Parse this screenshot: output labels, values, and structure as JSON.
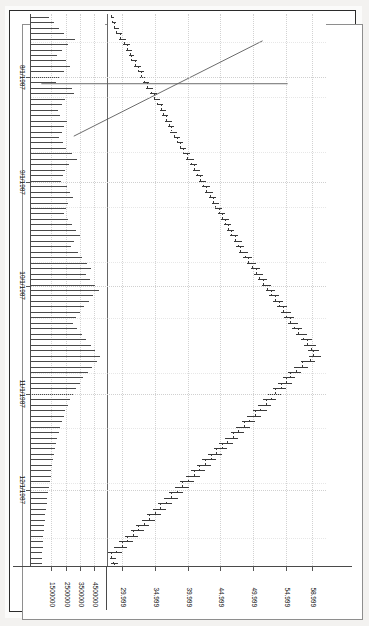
{
  "app": {
    "name": "TradeStation",
    "watermark": "Created with TradeStation www.TradeStation.com"
  },
  "chart_header": {
    "symbol_line": "AAPL-Daily"
  },
  "chart_data": {
    "type": "ohlc",
    "title": "AAPL-Daily",
    "subtitle": "Created with TradeStation www.TradeStation.com",
    "xlabel": "",
    "ylabel": "",
    "orientation": "page-rotated-90",
    "grid": true,
    "legend": "none",
    "price_axis": {
      "ticks": [
        "58.999",
        "54.999",
        "49.999",
        "44.999",
        "39.999",
        "34.999",
        "29.999"
      ],
      "values": [
        58.999,
        54.999,
        49.999,
        44.999,
        39.999,
        34.999,
        29.999
      ],
      "ylim": [
        27.5,
        61.0
      ]
    },
    "volume_axis": {
      "ticks": [
        "4500000",
        "3500000",
        "2500000",
        "1500000"
      ],
      "values": [
        4500000,
        3500000,
        2500000,
        1500000
      ],
      "ylim": [
        0,
        5200000
      ]
    },
    "date_axis": {
      "ticks": [
        "8/1/1987",
        "9/1/1987",
        "10/1/1987",
        "11/1/1987",
        "12/1/1987"
      ],
      "positions": [
        0.115,
        0.305,
        0.492,
        0.688,
        0.862
      ]
    },
    "annotations": [
      {
        "name": "downtrend-line-upper",
        "x1": 0.045,
        "y1": 0.215,
        "x2": 0.205,
        "y2": 0.855
      },
      {
        "name": "vertical-marker-line",
        "x1": 0.117,
        "y1": 0.13,
        "x2": 0.117,
        "y2": 0.965
      }
    ],
    "bars": [
      {
        "o": 28.3,
        "h": 28.6,
        "l": 28.05,
        "c": 28.4,
        "v": 1250000
      },
      {
        "o": 28.4,
        "h": 28.95,
        "l": 28.25,
        "c": 28.8,
        "v": 1640000
      },
      {
        "o": 28.8,
        "h": 29.3,
        "l": 28.6,
        "c": 29.1,
        "v": 1980000
      },
      {
        "o": 29.1,
        "h": 29.8,
        "l": 28.95,
        "c": 29.6,
        "v": 2350000
      },
      {
        "o": 29.6,
        "h": 30.4,
        "l": 29.4,
        "c": 30.2,
        "v": 3100000
      },
      {
        "o": 30.2,
        "h": 30.95,
        "l": 30.0,
        "c": 30.7,
        "v": 2600000
      },
      {
        "o": 30.7,
        "h": 31.4,
        "l": 30.45,
        "c": 31.1,
        "v": 2150000
      },
      {
        "o": 31.1,
        "h": 31.6,
        "l": 30.85,
        "c": 31.25,
        "v": 1820000
      },
      {
        "o": 31.25,
        "h": 32.1,
        "l": 31.1,
        "c": 31.9,
        "v": 2480000
      },
      {
        "o": 31.9,
        "h": 32.7,
        "l": 31.7,
        "c": 32.45,
        "v": 2720000
      },
      {
        "o": 32.45,
        "h": 33.1,
        "l": 32.2,
        "c": 32.85,
        "v": 2300000
      },
      {
        "o": 32.85,
        "h": 33.5,
        "l": 32.6,
        "c": 33.3,
        "v": 1960000
      },
      {
        "o": 33.3,
        "h": 33.95,
        "l": 33.05,
        "c": 33.7,
        "v": 1740000
      },
      {
        "o": 33.7,
        "h": 34.6,
        "l": 33.5,
        "c": 34.4,
        "v": 2880000
      },
      {
        "o": 34.4,
        "h": 35.2,
        "l": 34.1,
        "c": 34.9,
        "v": 3050000
      },
      {
        "o": 34.9,
        "h": 35.6,
        "l": 34.65,
        "c": 35.35,
        "v": 2420000
      },
      {
        "o": 35.35,
        "h": 36.1,
        "l": 35.1,
        "c": 35.85,
        "v": 2190000
      },
      {
        "o": 35.85,
        "h": 36.5,
        "l": 35.55,
        "c": 36.2,
        "v": 1880000
      },
      {
        "o": 36.2,
        "h": 36.9,
        "l": 35.95,
        "c": 36.65,
        "v": 2060000
      },
      {
        "o": 36.65,
        "h": 37.4,
        "l": 36.4,
        "c": 37.1,
        "v": 2540000
      },
      {
        "o": 37.1,
        "h": 37.8,
        "l": 36.85,
        "c": 37.45,
        "v": 2310000
      },
      {
        "o": 37.45,
        "h": 38.2,
        "l": 37.2,
        "c": 37.95,
        "v": 2170000
      },
      {
        "o": 37.95,
        "h": 38.7,
        "l": 37.7,
        "c": 38.4,
        "v": 1990000
      },
      {
        "o": 38.4,
        "h": 39.1,
        "l": 38.15,
        "c": 38.85,
        "v": 2260000
      },
      {
        "o": 38.85,
        "h": 39.6,
        "l": 38.6,
        "c": 39.3,
        "v": 2480000
      },
      {
        "o": 39.3,
        "h": 40.2,
        "l": 39.05,
        "c": 39.9,
        "v": 2900000
      },
      {
        "o": 39.9,
        "h": 40.8,
        "l": 39.65,
        "c": 40.5,
        "v": 3200000
      },
      {
        "o": 40.5,
        "h": 41.3,
        "l": 40.2,
        "c": 40.95,
        "v": 2650000
      },
      {
        "o": 40.95,
        "h": 41.7,
        "l": 40.7,
        "c": 41.4,
        "v": 2410000
      },
      {
        "o": 41.4,
        "h": 42.2,
        "l": 41.1,
        "c": 41.85,
        "v": 2280000
      },
      {
        "o": 41.85,
        "h": 42.6,
        "l": 41.55,
        "c": 42.3,
        "v": 2120000
      },
      {
        "o": 42.3,
        "h": 43.2,
        "l": 42.0,
        "c": 42.85,
        "v": 2560000
      },
      {
        "o": 42.85,
        "h": 43.7,
        "l": 42.55,
        "c": 43.35,
        "v": 2740000
      },
      {
        "o": 43.35,
        "h": 44.2,
        "l": 43.05,
        "c": 43.8,
        "v": 2930000
      },
      {
        "o": 43.8,
        "h": 44.6,
        "l": 43.5,
        "c": 44.2,
        "v": 2610000
      },
      {
        "o": 44.2,
        "h": 45.1,
        "l": 43.95,
        "c": 44.75,
        "v": 2480000
      },
      {
        "o": 44.75,
        "h": 45.6,
        "l": 44.45,
        "c": 45.2,
        "v": 2350000
      },
      {
        "o": 45.2,
        "h": 46.1,
        "l": 44.9,
        "c": 45.7,
        "v": 2620000
      },
      {
        "o": 45.7,
        "h": 46.5,
        "l": 45.4,
        "c": 46.1,
        "v": 2870000
      },
      {
        "o": 46.1,
        "h": 47.0,
        "l": 45.8,
        "c": 46.6,
        "v": 3140000
      },
      {
        "o": 46.6,
        "h": 47.6,
        "l": 46.3,
        "c": 47.2,
        "v": 3460000
      },
      {
        "o": 47.2,
        "h": 48.1,
        "l": 46.85,
        "c": 47.65,
        "v": 3050000
      },
      {
        "o": 47.65,
        "h": 48.5,
        "l": 47.3,
        "c": 48.05,
        "v": 2780000
      },
      {
        "o": 48.05,
        "h": 49.1,
        "l": 47.75,
        "c": 48.7,
        "v": 3320000
      },
      {
        "o": 48.7,
        "h": 49.7,
        "l": 48.35,
        "c": 49.25,
        "v": 3580000
      },
      {
        "o": 49.25,
        "h": 50.3,
        "l": 48.95,
        "c": 49.85,
        "v": 3910000
      },
      {
        "o": 49.85,
        "h": 50.9,
        "l": 49.5,
        "c": 50.4,
        "v": 4250000
      },
      {
        "o": 50.4,
        "h": 51.4,
        "l": 50.05,
        "c": 50.95,
        "v": 3880000
      },
      {
        "o": 50.95,
        "h": 52.0,
        "l": 50.6,
        "c": 51.55,
        "v": 4120000
      },
      {
        "o": 51.55,
        "h": 52.6,
        "l": 51.2,
        "c": 52.1,
        "v": 4480000
      },
      {
        "o": 52.1,
        "h": 53.2,
        "l": 51.75,
        "c": 52.7,
        "v": 4760000
      },
      {
        "o": 52.7,
        "h": 53.8,
        "l": 52.3,
        "c": 53.3,
        "v": 4390000
      },
      {
        "o": 53.3,
        "h": 54.4,
        "l": 52.9,
        "c": 53.9,
        "v": 4050000
      },
      {
        "o": 53.9,
        "h": 55.0,
        "l": 53.5,
        "c": 54.5,
        "v": 3720000
      },
      {
        "o": 54.5,
        "h": 55.6,
        "l": 54.1,
        "c": 55.05,
        "v": 3410000
      },
      {
        "o": 55.05,
        "h": 56.1,
        "l": 54.6,
        "c": 55.6,
        "v": 3180000
      },
      {
        "o": 55.6,
        "h": 56.7,
        "l": 55.2,
        "c": 56.2,
        "v": 2960000
      },
      {
        "o": 56.2,
        "h": 57.4,
        "l": 55.8,
        "c": 56.9,
        "v": 3240000
      },
      {
        "o": 56.9,
        "h": 58.1,
        "l": 56.45,
        "c": 57.6,
        "v": 3560000
      },
      {
        "o": 57.6,
        "h": 58.8,
        "l": 57.1,
        "c": 58.2,
        "v": 3880000
      },
      {
        "o": 58.2,
        "h": 59.4,
        "l": 57.7,
        "c": 58.8,
        "v": 4200000
      },
      {
        "o": 58.8,
        "h": 59.9,
        "l": 58.2,
        "c": 59.2,
        "v": 4520000
      },
      {
        "o": 59.2,
        "h": 60.2,
        "l": 58.4,
        "c": 58.7,
        "v": 4880000
      },
      {
        "o": 58.7,
        "h": 59.3,
        "l": 57.1,
        "c": 57.5,
        "v": 4640000
      },
      {
        "o": 57.5,
        "h": 58.2,
        "l": 56.1,
        "c": 56.6,
        "v": 4310000
      },
      {
        "o": 56.6,
        "h": 57.1,
        "l": 55.2,
        "c": 55.6,
        "v": 3980000
      },
      {
        "o": 55.6,
        "h": 56.3,
        "l": 54.4,
        "c": 55.0,
        "v": 3650000
      },
      {
        "o": 55.0,
        "h": 55.8,
        "l": 53.7,
        "c": 54.2,
        "v": 3420000
      },
      {
        "o": 54.2,
        "h": 54.9,
        "l": 52.9,
        "c": 53.4,
        "v": 3180000
      },
      {
        "o": 53.4,
        "h": 54.1,
        "l": 52.2,
        "c": 52.7,
        "v": 2940000
      },
      {
        "o": 52.7,
        "h": 53.4,
        "l": 51.4,
        "c": 51.9,
        "v": 2760000
      },
      {
        "o": 51.9,
        "h": 52.6,
        "l": 50.6,
        "c": 51.1,
        "v": 2580000
      },
      {
        "o": 51.1,
        "h": 51.9,
        "l": 49.8,
        "c": 50.3,
        "v": 2410000
      },
      {
        "o": 50.3,
        "h": 51.0,
        "l": 48.9,
        "c": 49.4,
        "v": 2290000
      },
      {
        "o": 49.4,
        "h": 50.2,
        "l": 48.1,
        "c": 48.6,
        "v": 2170000
      },
      {
        "o": 48.6,
        "h": 49.3,
        "l": 47.2,
        "c": 47.7,
        "v": 2050000
      },
      {
        "o": 47.7,
        "h": 48.5,
        "l": 46.4,
        "c": 46.9,
        "v": 1940000
      },
      {
        "o": 46.9,
        "h": 47.6,
        "l": 45.5,
        "c": 46.0,
        "v": 1830000
      },
      {
        "o": 46.0,
        "h": 46.8,
        "l": 44.7,
        "c": 45.2,
        "v": 1760000
      },
      {
        "o": 45.2,
        "h": 45.9,
        "l": 43.8,
        "c": 44.3,
        "v": 1690000
      },
      {
        "o": 44.3,
        "h": 45.1,
        "l": 43.0,
        "c": 43.5,
        "v": 1620000
      },
      {
        "o": 43.5,
        "h": 44.2,
        "l": 42.1,
        "c": 42.6,
        "v": 1560000
      },
      {
        "o": 42.6,
        "h": 43.4,
        "l": 41.3,
        "c": 41.8,
        "v": 1490000
      },
      {
        "o": 41.8,
        "h": 42.5,
        "l": 40.4,
        "c": 40.9,
        "v": 1430000
      },
      {
        "o": 40.9,
        "h": 41.7,
        "l": 39.6,
        "c": 40.1,
        "v": 1380000
      },
      {
        "o": 40.1,
        "h": 40.8,
        "l": 38.7,
        "c": 39.2,
        "v": 1320000
      },
      {
        "o": 39.2,
        "h": 40.0,
        "l": 37.9,
        "c": 38.4,
        "v": 1270000
      },
      {
        "o": 38.4,
        "h": 39.1,
        "l": 37.0,
        "c": 37.5,
        "v": 1210000
      },
      {
        "o": 37.5,
        "h": 38.3,
        "l": 36.2,
        "c": 36.7,
        "v": 1160000
      },
      {
        "o": 36.7,
        "h": 37.4,
        "l": 35.3,
        "c": 35.8,
        "v": 1110000
      },
      {
        "o": 35.8,
        "h": 36.6,
        "l": 34.5,
        "c": 35.0,
        "v": 1060000
      },
      {
        "o": 35.0,
        "h": 35.7,
        "l": 33.6,
        "c": 34.1,
        "v": 1020000
      },
      {
        "o": 34.1,
        "h": 34.9,
        "l": 32.8,
        "c": 33.3,
        "v": 980000
      },
      {
        "o": 33.3,
        "h": 34.0,
        "l": 31.9,
        "c": 32.4,
        "v": 940000
      },
      {
        "o": 32.4,
        "h": 33.2,
        "l": 31.1,
        "c": 31.6,
        "v": 900000
      },
      {
        "o": 31.6,
        "h": 32.3,
        "l": 30.2,
        "c": 30.7,
        "v": 870000
      },
      {
        "o": 30.7,
        "h": 31.5,
        "l": 29.4,
        "c": 29.9,
        "v": 840000
      },
      {
        "o": 29.9,
        "h": 30.6,
        "l": 28.5,
        "c": 29.0,
        "v": 810000
      },
      {
        "o": 29.0,
        "h": 29.8,
        "l": 27.7,
        "c": 28.2,
        "v": 780000
      },
      {
        "o": 28.2,
        "h": 28.9,
        "l": 27.9,
        "c": 28.5,
        "v": 760000
      },
      {
        "o": 28.5,
        "h": 29.2,
        "l": 28.1,
        "c": 28.8,
        "v": 740000
      }
    ]
  }
}
